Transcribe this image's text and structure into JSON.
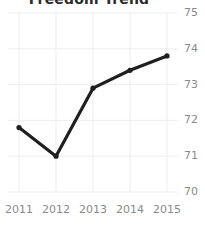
{
  "chart_data": {
    "type": "line",
    "title": "Freedom Trend",
    "xlabel": "",
    "ylabel": "",
    "categories": [
      "2011",
      "2012",
      "2013",
      "2014",
      "2015"
    ],
    "x": [
      2011,
      2012,
      2013,
      2014,
      2015
    ],
    "values": [
      71.8,
      71.0,
      72.9,
      73.4,
      73.8
    ],
    "series": [
      {
        "name": "Freedom Trend",
        "values": [
          71.8,
          71.0,
          72.9,
          73.4,
          73.8
        ]
      }
    ],
    "ylim": [
      70,
      75
    ],
    "yticks": [
      70,
      71,
      72,
      73,
      74,
      75
    ],
    "ytick_labels": [
      "70",
      "71",
      "72",
      "73",
      "74",
      "75"
    ],
    "xticks": [
      2011,
      2012,
      2013,
      2014,
      2015
    ],
    "xtick_labels": [
      "2011",
      "2012",
      "2013",
      "2014",
      "2015"
    ],
    "grid": true,
    "grid_axis": "both",
    "legend": false,
    "legend_position": "none",
    "y_axis_side": "right",
    "marker": "circle",
    "line_color": "#1f1f1f",
    "grid_color": "#ededed",
    "tick_label_color": "#8a8a8a",
    "background_color": "#ffffff",
    "title_clipped": true
  }
}
